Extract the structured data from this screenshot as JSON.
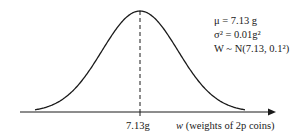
{
  "chart_data": {
    "type": "line",
    "title": "",
    "mean": 7.13,
    "variance": 0.01,
    "std_dev": 0.1,
    "xlabel": "w (weights of 2p coins)",
    "x_tick_labels": [
      "7.13g"
    ],
    "annotations": [
      "μ = 7.13 g",
      "σ² = 0.01g²",
      "W ~ N(7.13, 0.1²)"
    ],
    "grid": false,
    "legend": null
  },
  "params": {
    "mu": "μ = 7.13 g",
    "sigma": "σ² = 0.01g²",
    "dist": "W ~ N(7.13, 0.1²)"
  },
  "axis": {
    "tick": "7.13g",
    "var": "w",
    "label_rest": " (weights of 2p coins)"
  }
}
